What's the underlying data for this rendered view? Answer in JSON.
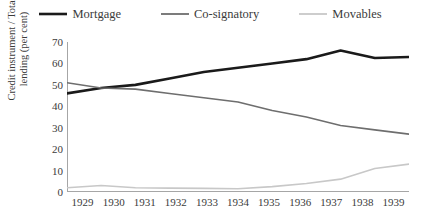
{
  "chart_data": {
    "type": "line",
    "title": "",
    "subtitle": "",
    "xlabel": "",
    "ylabel": "Credit instrument / Total lending (per cent)",
    "ylabel_line1": "Credit instrument / Total",
    "ylabel_line2": "lending (per cent)",
    "categories": [
      "1929",
      "1930",
      "1931",
      "1932",
      "1933",
      "1934",
      "1935",
      "1936",
      "1937",
      "1938",
      "1939"
    ],
    "ylim": [
      0,
      70
    ],
    "yticks": [
      70,
      60,
      50,
      40,
      30,
      20,
      10,
      0
    ],
    "grid": false,
    "legend_position": "top",
    "series": [
      {
        "name": "Mortgage",
        "color": "#1a1a1a",
        "width": 2.6,
        "values": [
          46,
          48.5,
          50,
          53,
          56,
          58,
          60,
          62,
          66,
          62.5,
          63
        ]
      },
      {
        "name": "Co-signatory",
        "color": "#6e6e6e",
        "width": 1.6,
        "values": [
          51,
          48.5,
          48,
          46,
          44,
          42,
          38,
          35,
          31,
          29,
          27
        ]
      },
      {
        "name": "Movables",
        "color": "#c8c8c8",
        "width": 1.6,
        "values": [
          2,
          3,
          2,
          1.8,
          1.7,
          1.5,
          2.5,
          4,
          6,
          11,
          13
        ]
      }
    ]
  },
  "colors": {
    "axis": "#a6a6a6",
    "text": "#3b3b3b",
    "background": "#ffffff"
  }
}
